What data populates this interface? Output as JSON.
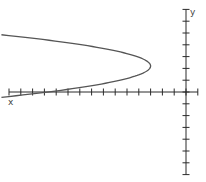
{
  "chart_data": {
    "type": "line",
    "title": "",
    "xlabel": "x",
    "ylabel": "y",
    "xlim": [
      -15,
      1
    ],
    "ylim": [
      -7,
      7
    ],
    "grid": false,
    "legend": null,
    "x_ticks": [
      -15,
      -14,
      -13,
      -12,
      -11,
      -10,
      -9,
      -8,
      -7,
      -6,
      -5,
      -4,
      -3,
      -2,
      -1,
      0,
      1
    ],
    "y_ticks": [
      -7,
      -6,
      -5,
      -4,
      -3,
      -2,
      -1,
      0,
      1,
      2,
      3,
      4,
      5,
      6,
      7
    ],
    "series": [
      {
        "name": "parabola",
        "equation": "x = -3 - 1.8*(y - 2.2)^2",
        "vertex": [
          -3,
          2.2
        ],
        "y_range": [
          -0.45,
          4.85
        ],
        "points": [
          {
            "x": -15.1,
            "y": 4.75
          },
          {
            "x": -10.2,
            "y": 4.2
          },
          {
            "x": -6.2,
            "y": 3.53
          },
          {
            "x": -3.8,
            "y": 2.87
          },
          {
            "x": -3.0,
            "y": 2.2
          },
          {
            "x": -3.8,
            "y": 1.53
          },
          {
            "x": -6.2,
            "y": 0.87
          },
          {
            "x": -10.2,
            "y": 0.2
          },
          {
            "x": -15.1,
            "y": -0.45
          }
        ],
        "color": "#555555"
      }
    ]
  },
  "labels": {
    "x_axis": "x",
    "y_axis": "y"
  },
  "layout": {
    "origin_px": [
      186,
      92
    ],
    "unit_px": 11.8
  }
}
